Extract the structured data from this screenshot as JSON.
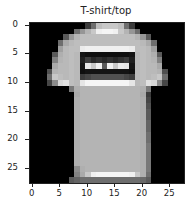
{
  "chart_data": {
    "type": "heatmap",
    "title": "T-shirt/top",
    "colormap": "gray",
    "xlabel": "",
    "ylabel": "",
    "xlim": [
      -0.5,
      27.5
    ],
    "ylim": [
      27.5,
      -0.5
    ],
    "xticks": [
      0,
      5,
      10,
      15,
      20,
      25
    ],
    "yticks": [
      0,
      5,
      10,
      15,
      20,
      25
    ],
    "grid": false,
    "shape": [
      28,
      28
    ],
    "values": [
      [
        0,
        0,
        0,
        0,
        0,
        0,
        0,
        0,
        0,
        0,
        60,
        110,
        190,
        200,
        200,
        200,
        190,
        110,
        60,
        0,
        0,
        0,
        0,
        0,
        0,
        0,
        0,
        0
      ],
      [
        0,
        0,
        0,
        0,
        0,
        0,
        0,
        0,
        110,
        150,
        180,
        200,
        240,
        245,
        245,
        240,
        200,
        180,
        150,
        110,
        0,
        0,
        0,
        0,
        0,
        0,
        0,
        0
      ],
      [
        0,
        0,
        0,
        0,
        0,
        0,
        90,
        150,
        180,
        190,
        190,
        190,
        190,
        190,
        190,
        190,
        190,
        190,
        190,
        180,
        150,
        90,
        0,
        0,
        0,
        0,
        0,
        0
      ],
      [
        0,
        0,
        0,
        0,
        0,
        110,
        170,
        185,
        190,
        190,
        190,
        190,
        190,
        190,
        190,
        190,
        190,
        190,
        190,
        190,
        185,
        170,
        110,
        0,
        0,
        0,
        0,
        0
      ],
      [
        0,
        0,
        0,
        0,
        0,
        160,
        185,
        190,
        190,
        235,
        240,
        240,
        240,
        240,
        240,
        240,
        240,
        240,
        235,
        190,
        190,
        185,
        160,
        0,
        0,
        0,
        0,
        0
      ],
      [
        0,
        0,
        0,
        0,
        90,
        175,
        185,
        190,
        185,
        20,
        15,
        15,
        15,
        15,
        15,
        15,
        15,
        15,
        20,
        185,
        190,
        185,
        175,
        90,
        0,
        0,
        0,
        0
      ],
      [
        0,
        0,
        0,
        0,
        130,
        180,
        185,
        190,
        185,
        30,
        60,
        40,
        50,
        40,
        50,
        40,
        50,
        60,
        30,
        185,
        190,
        185,
        180,
        130,
        0,
        0,
        0,
        0
      ],
      [
        0,
        0,
        0,
        0,
        170,
        185,
        185,
        190,
        185,
        20,
        230,
        200,
        240,
        90,
        240,
        200,
        235,
        230,
        20,
        185,
        190,
        185,
        185,
        170,
        0,
        0,
        0,
        0
      ],
      [
        0,
        0,
        0,
        80,
        180,
        185,
        185,
        190,
        185,
        15,
        20,
        20,
        20,
        20,
        20,
        20,
        20,
        20,
        15,
        185,
        190,
        185,
        185,
        180,
        80,
        0,
        0,
        0
      ],
      [
        0,
        0,
        0,
        110,
        200,
        190,
        185,
        190,
        185,
        60,
        70,
        80,
        80,
        80,
        80,
        80,
        80,
        70,
        60,
        185,
        190,
        185,
        190,
        200,
        110,
        0,
        0,
        0
      ],
      [
        0,
        0,
        0,
        70,
        140,
        215,
        225,
        190,
        185,
        230,
        245,
        245,
        245,
        245,
        245,
        245,
        245,
        245,
        230,
        185,
        190,
        225,
        215,
        140,
        70,
        0,
        0,
        0
      ],
      [
        0,
        0,
        0,
        0,
        0,
        0,
        0,
        120,
        175,
        180,
        180,
        180,
        180,
        180,
        180,
        180,
        180,
        180,
        180,
        180,
        175,
        120,
        0,
        0,
        0,
        0,
        0,
        0
      ],
      [
        0,
        0,
        0,
        0,
        0,
        0,
        0,
        0,
        170,
        180,
        180,
        180,
        180,
        180,
        180,
        180,
        180,
        180,
        180,
        180,
        170,
        60,
        0,
        0,
        0,
        0,
        0,
        0
      ],
      [
        0,
        0,
        0,
        0,
        0,
        0,
        0,
        0,
        175,
        180,
        180,
        180,
        180,
        180,
        180,
        180,
        180,
        180,
        180,
        180,
        175,
        70,
        0,
        0,
        0,
        0,
        0,
        0
      ],
      [
        0,
        0,
        0,
        0,
        0,
        0,
        0,
        0,
        175,
        180,
        180,
        180,
        180,
        180,
        180,
        180,
        180,
        180,
        180,
        180,
        175,
        80,
        0,
        0,
        0,
        0,
        0,
        0
      ],
      [
        0,
        0,
        0,
        0,
        0,
        0,
        0,
        0,
        175,
        180,
        180,
        180,
        180,
        180,
        180,
        180,
        180,
        180,
        180,
        180,
        175,
        90,
        0,
        0,
        0,
        0,
        0,
        0
      ],
      [
        0,
        0,
        0,
        0,
        0,
        0,
        0,
        0,
        175,
        180,
        180,
        180,
        180,
        180,
        180,
        180,
        180,
        180,
        180,
        180,
        175,
        90,
        0,
        0,
        0,
        0,
        0,
        0
      ],
      [
        0,
        0,
        0,
        0,
        0,
        0,
        0,
        0,
        175,
        180,
        180,
        180,
        180,
        180,
        180,
        180,
        180,
        180,
        180,
        180,
        175,
        100,
        0,
        0,
        0,
        0,
        0,
        0
      ],
      [
        0,
        0,
        0,
        0,
        0,
        0,
        0,
        0,
        175,
        180,
        180,
        180,
        180,
        180,
        180,
        180,
        180,
        180,
        180,
        180,
        175,
        100,
        0,
        0,
        0,
        0,
        0,
        0
      ],
      [
        0,
        0,
        0,
        0,
        0,
        0,
        0,
        0,
        175,
        180,
        180,
        180,
        180,
        180,
        180,
        180,
        180,
        180,
        180,
        180,
        175,
        110,
        0,
        0,
        0,
        0,
        0,
        0
      ],
      [
        0,
        0,
        0,
        0,
        0,
        0,
        0,
        0,
        175,
        180,
        180,
        180,
        180,
        180,
        180,
        180,
        180,
        180,
        180,
        180,
        175,
        110,
        0,
        0,
        0,
        0,
        0,
        0
      ],
      [
        0,
        0,
        0,
        0,
        0,
        0,
        0,
        0,
        175,
        180,
        180,
        180,
        180,
        180,
        180,
        180,
        180,
        180,
        180,
        180,
        175,
        120,
        0,
        0,
        0,
        0,
        0,
        0
      ],
      [
        0,
        0,
        0,
        0,
        0,
        0,
        0,
        0,
        175,
        180,
        180,
        180,
        180,
        180,
        180,
        180,
        180,
        180,
        180,
        180,
        175,
        120,
        0,
        0,
        0,
        0,
        0,
        0
      ],
      [
        0,
        0,
        0,
        0,
        0,
        0,
        0,
        0,
        175,
        180,
        180,
        180,
        180,
        180,
        180,
        180,
        180,
        180,
        180,
        180,
        175,
        120,
        0,
        0,
        0,
        0,
        0,
        0
      ],
      [
        0,
        0,
        0,
        0,
        0,
        0,
        0,
        0,
        175,
        180,
        180,
        180,
        180,
        180,
        180,
        180,
        180,
        180,
        180,
        180,
        175,
        120,
        0,
        0,
        0,
        0,
        0,
        0
      ],
      [
        0,
        0,
        0,
        0,
        0,
        0,
        0,
        0,
        140,
        175,
        180,
        180,
        180,
        180,
        180,
        180,
        180,
        180,
        180,
        180,
        175,
        120,
        0,
        0,
        0,
        0,
        0,
        0
      ],
      [
        0,
        0,
        0,
        0,
        0,
        0,
        0,
        0,
        130,
        170,
        200,
        240,
        245,
        245,
        245,
        245,
        245,
        245,
        240,
        200,
        175,
        110,
        0,
        0,
        0,
        0,
        0,
        0
      ],
      [
        0,
        0,
        0,
        0,
        0,
        0,
        0,
        90,
        100,
        110,
        110,
        110,
        110,
        110,
        110,
        110,
        110,
        110,
        110,
        110,
        105,
        90,
        0,
        0,
        0,
        0,
        0,
        0
      ]
    ]
  }
}
